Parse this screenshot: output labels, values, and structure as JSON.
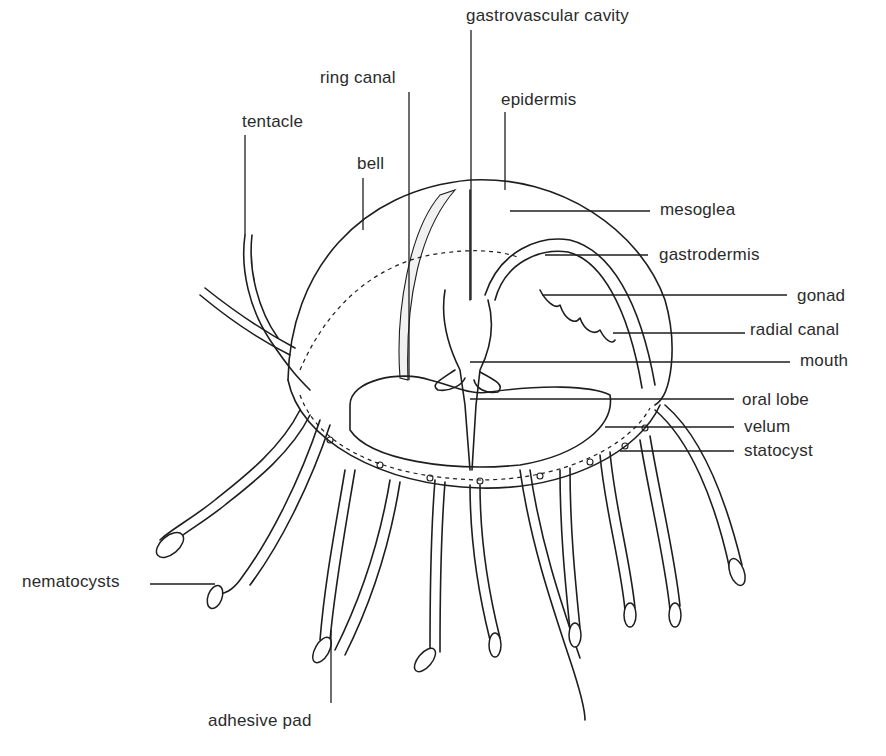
{
  "diagram": {
    "labels": [
      {
        "id": "gastrovascular-cavity",
        "text": "gastrovascular cavity",
        "x": 466,
        "y": 6,
        "anchor": {
          "x": 471,
          "y": 30,
          "to_x": 471,
          "to_y": 300
        }
      },
      {
        "id": "ring-canal",
        "text": "ring canal",
        "x": 320,
        "y": 68,
        "anchor": {
          "x": 409,
          "y": 92,
          "to_x": 409,
          "to_y": 380
        }
      },
      {
        "id": "epidermis",
        "text": "epidermis",
        "x": 501,
        "y": 90,
        "anchor": {
          "x": 505,
          "y": 112,
          "to_x": 505,
          "to_y": 190
        }
      },
      {
        "id": "tentacle",
        "text": "tentacle",
        "x": 242,
        "y": 112,
        "anchor": {
          "x": 245,
          "y": 135,
          "to_x": 245,
          "to_y": 235
        }
      },
      {
        "id": "bell",
        "text": "bell",
        "x": 357,
        "y": 154,
        "anchor": {
          "x": 363,
          "y": 178,
          "to_x": 363,
          "to_y": 230
        }
      },
      {
        "id": "mesoglea",
        "text": "mesoglea",
        "x": 660,
        "y": 200,
        "anchor": {
          "x": 510,
          "y": 211,
          "to_x": 650,
          "to_y": 211
        }
      },
      {
        "id": "gastrodermis",
        "text": "gastrodermis",
        "x": 659,
        "y": 245,
        "anchor": {
          "x": 545,
          "y": 255,
          "to_x": 648,
          "to_y": 255
        }
      },
      {
        "id": "gonad",
        "text": "gonad",
        "x": 797,
        "y": 286,
        "anchor": {
          "x": 542,
          "y": 295,
          "to_x": 787,
          "to_y": 295
        }
      },
      {
        "id": "radial-canal",
        "text": "radial canal",
        "x": 750,
        "y": 320,
        "anchor": {
          "x": 613,
          "y": 333,
          "to_x": 745,
          "to_y": 333
        }
      },
      {
        "id": "mouth",
        "text": "mouth",
        "x": 800,
        "y": 351,
        "anchor": {
          "x": 470,
          "y": 362,
          "to_x": 790,
          "to_y": 362
        }
      },
      {
        "id": "oral-lobe",
        "text": "oral lobe",
        "x": 742,
        "y": 390,
        "anchor": {
          "x": 470,
          "y": 399,
          "to_x": 734,
          "to_y": 399
        }
      },
      {
        "id": "velum",
        "text": "velum",
        "x": 744,
        "y": 417,
        "anchor": {
          "x": 605,
          "y": 427,
          "to_x": 734,
          "to_y": 427
        }
      },
      {
        "id": "statocyst",
        "text": "statocyst",
        "x": 744,
        "y": 441,
        "anchor": {
          "x": 620,
          "y": 451,
          "to_x": 734,
          "to_y": 451
        }
      },
      {
        "id": "nematocysts",
        "text": "nematocysts",
        "x": 22,
        "y": 572,
        "anchor": {
          "x": 150,
          "y": 584,
          "to_x": 215,
          "to_y": 584
        }
      },
      {
        "id": "adhesive-pad",
        "text": "adhesive pad",
        "x": 208,
        "y": 711,
        "anchor": {
          "x": 331,
          "y": 630,
          "to_x": 331,
          "to_y": 703
        }
      }
    ]
  }
}
